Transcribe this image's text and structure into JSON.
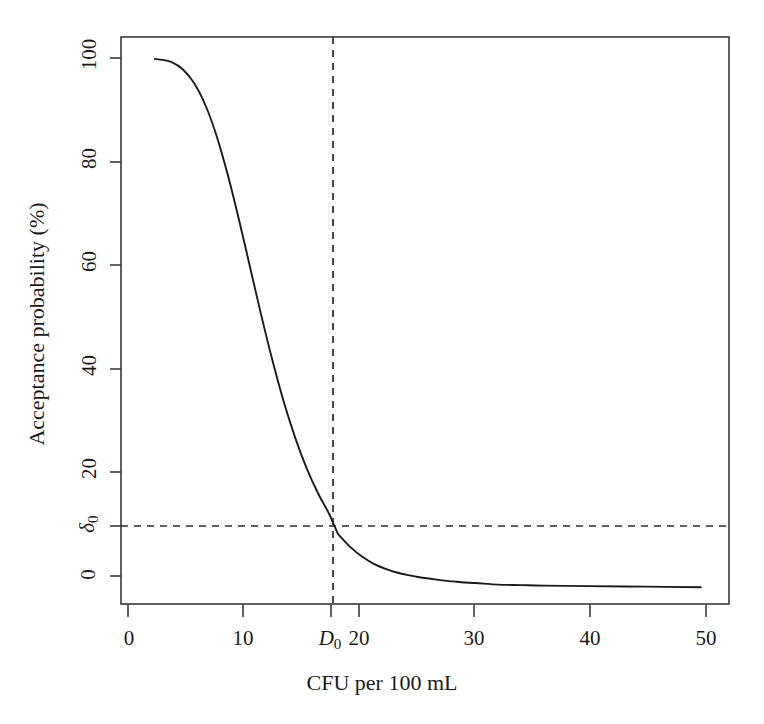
{
  "chart_data": {
    "type": "line",
    "title": "",
    "xlabel": "CFU per 100 mL",
    "ylabel": "Acceptance probability (%)",
    "xlim": [
      -1.5,
      52.5
    ],
    "ylim": [
      -4,
      104
    ],
    "grid": false,
    "legend": null,
    "x_ticks": [
      {
        "value": 0,
        "label": "0"
      },
      {
        "value": 10,
        "label": "10"
      },
      {
        "value": 17.7,
        "label": "D0",
        "label_html": "D₀",
        "special": true
      },
      {
        "value": 20,
        "label": "20"
      },
      {
        "value": 30,
        "label": "30"
      },
      {
        "value": 40,
        "label": "40"
      },
      {
        "value": 50,
        "label": "50"
      }
    ],
    "y_ticks": [
      {
        "value": 0,
        "label": "0"
      },
      {
        "value": 9.7,
        "label": "d0",
        "label_html": "δ₀",
        "special": true
      },
      {
        "value": 20,
        "label": "20"
      },
      {
        "value": 40,
        "label": "40"
      },
      {
        "value": 60,
        "label": "60"
      },
      {
        "value": 80,
        "label": "80"
      },
      {
        "value": 100,
        "label": "100"
      }
    ],
    "annotations": [
      {
        "name": "vertical-reference-line",
        "kind": "vline",
        "x": 17.7,
        "label": "D₀",
        "style": "dashed"
      },
      {
        "name": "horizontal-reference-line",
        "kind": "hline",
        "y": 9.7,
        "label": "δ₀",
        "style": "dashed"
      }
    ],
    "series": [
      {
        "name": "Acceptance probability curve",
        "color": "#1a1a1a",
        "style": "solid",
        "x": [
          1.5,
          2,
          3,
          4,
          5,
          6,
          7,
          8,
          9,
          10,
          11,
          12,
          13,
          14,
          15,
          16,
          17,
          17.7,
          18,
          19,
          20,
          21,
          22,
          23,
          24,
          25,
          26,
          27,
          28,
          29,
          30,
          32,
          34,
          36,
          40,
          45,
          50
        ],
        "y": [
          99.8,
          99.7,
          99.2,
          97.8,
          95.2,
          91.0,
          85.1,
          77.6,
          69.0,
          59.8,
          50.6,
          42.0,
          34.2,
          27.5,
          21.8,
          17.1,
          13.1,
          9.7,
          8.8,
          6.6,
          4.9,
          3.6,
          2.7,
          2.0,
          1.5,
          1.1,
          0.8,
          0.5,
          0.3,
          0.1,
          0.0,
          -0.3,
          -0.4,
          -0.5,
          -0.6,
          -0.7,
          -0.8
        ]
      }
    ]
  },
  "axes": {
    "x_axis_name": "CFU per 100 mL axis",
    "y_axis_name": "Acceptance probability axis"
  },
  "geometry": {
    "plot_left": 121,
    "plot_right": 729,
    "plot_top": 37,
    "plot_bottom": 604
  }
}
